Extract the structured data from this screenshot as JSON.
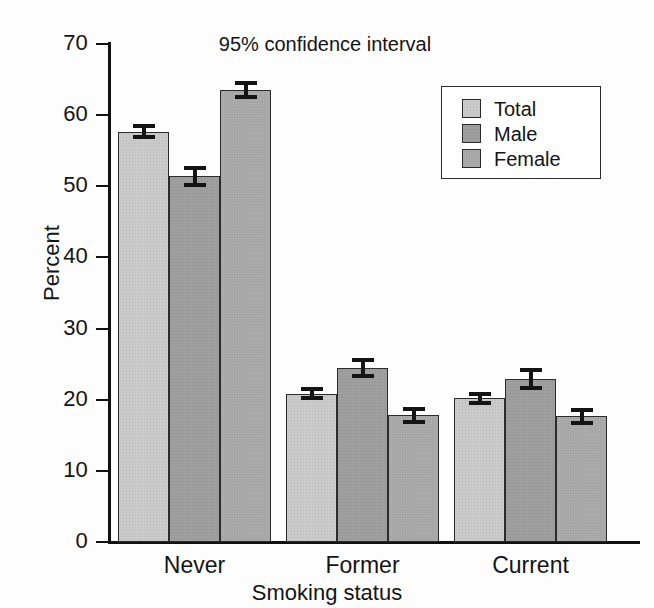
{
  "chart_data": {
    "type": "bar",
    "title": "",
    "annotation": "95% confidence interval",
    "xlabel": "Smoking status",
    "ylabel": "Percent",
    "categories": [
      "Never",
      "Former",
      "Current"
    ],
    "ylim": [
      0,
      70
    ],
    "yticks": [
      0,
      10,
      20,
      30,
      40,
      50,
      60,
      70
    ],
    "ytick_labels": [
      "0",
      "10",
      "20",
      "30",
      "40",
      "50",
      "60",
      "70"
    ],
    "grid": false,
    "legend_position": "top-right",
    "series": [
      {
        "name": "Total",
        "color": "#c8c8c8",
        "values": [
          57.7,
          20.8,
          20.2
        ],
        "ci_low": [
          56.6,
          19.9,
          19.3
        ],
        "ci_high": [
          58.8,
          21.8,
          21.1
        ]
      },
      {
        "name": "Male",
        "color": "#9d9d9d",
        "values": [
          51.4,
          24.4,
          22.9
        ],
        "ci_low": [
          49.9,
          23.1,
          21.4
        ],
        "ci_high": [
          52.8,
          25.9,
          24.5
        ]
      },
      {
        "name": "Female",
        "color": "#a8a8a8",
        "values": [
          63.5,
          17.9,
          17.7
        ],
        "ci_low": [
          62.2,
          16.6,
          16.4
        ],
        "ci_high": [
          64.8,
          19.0,
          18.9
        ]
      }
    ]
  },
  "legend": {
    "items": [
      {
        "label": "Total"
      },
      {
        "label": "Male"
      },
      {
        "label": "Female"
      }
    ]
  },
  "axis": {
    "y_label": "Percent",
    "x_label": "Smoking status",
    "y_ticks": [
      "70",
      "60",
      "50",
      "40",
      "30",
      "20",
      "10",
      "0"
    ]
  },
  "groups": [
    {
      "label": "Never"
    },
    {
      "label": "Former"
    },
    {
      "label": "Current"
    }
  ],
  "annotation": {
    "text": "95% confidence interval"
  },
  "colors": {
    "total": "#c8c8c8",
    "male": "#9d9d9d",
    "female": "#a8a8a8",
    "axis": "#111111",
    "text": "#141414",
    "background": "#ffffff"
  }
}
